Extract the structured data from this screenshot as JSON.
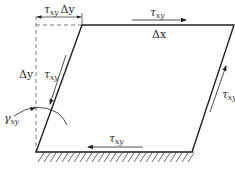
{
  "diagram": {
    "colors": {
      "line": "#222222",
      "dashed": "#555555",
      "hatch": "#444444",
      "background": "#ffffff"
    },
    "labels": {
      "top_offset": {
        "main": "τ",
        "sub": "xy",
        "suffix": "Δy"
      },
      "top_shear": {
        "main": "τ",
        "sub": "xy"
      },
      "top_width": "Δx",
      "left_height": "Δy",
      "left_shear": {
        "main": "τ",
        "sub": "xy"
      },
      "right_shear": {
        "main": "τ",
        "sub": "xy"
      },
      "bottom_shear": {
        "main": "τ",
        "sub": "xy"
      },
      "angle": {
        "main": "γ",
        "sub": "xy"
      }
    },
    "nodes": [
      {
        "id": "bottom-left",
        "x": 36,
        "y": 152
      },
      {
        "id": "bottom-right",
        "x": 192,
        "y": 152
      },
      {
        "id": "top-right",
        "x": 234,
        "y": 25
      },
      {
        "id": "top-left",
        "x": 82,
        "y": 25
      }
    ],
    "support": "fixed base (hatched)"
  }
}
